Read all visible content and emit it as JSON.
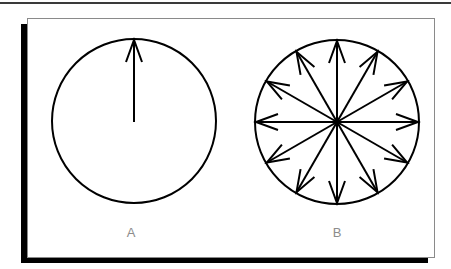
{
  "figure": {
    "colors": {
      "stroke": "#000000",
      "label": "#8c8c8c",
      "frame_border": "#8a8a8a",
      "shadow": "#000000",
      "top_rule": "#3a3a3a"
    },
    "panels": [
      {
        "id": "A",
        "label": "A",
        "arrow_count": 1,
        "arrow_directions": [
          "up"
        ]
      },
      {
        "id": "B",
        "label": "B",
        "arrow_count": 12,
        "arrow_angle_step_deg": 30
      }
    ]
  }
}
